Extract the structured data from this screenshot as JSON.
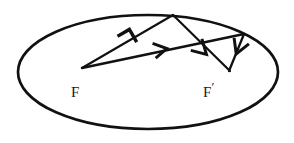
{
  "figure": {
    "stroke_color": "#111111",
    "background_color": "#ffffff",
    "labels": {
      "focus_left": "F",
      "focus_right": "F",
      "focus_right_prime": "′"
    },
    "ellipse": {
      "center_x": 148,
      "center_y": 72,
      "radius_x": 131,
      "radius_y": 58,
      "stroke_width": 2.6
    },
    "points": {
      "focus_left": [
        82,
        68
      ],
      "focus_right": [
        213,
        68
      ],
      "reflection_top": [
        172,
        15
      ],
      "reflection_right": [
        243,
        34
      ],
      "ray_end_lower": [
        230,
        71
      ]
    },
    "segments": [
      {
        "name": "ray-f-to-top-vertex",
        "from": [
          82,
          68
        ],
        "to": [
          172,
          15
        ]
      },
      {
        "name": "ray-f-to-right-vertex",
        "from": [
          82,
          68
        ],
        "to": [
          243,
          34
        ]
      },
      {
        "name": "reflected-top-to-fprime",
        "from": [
          172,
          15
        ],
        "to": [
          230,
          71
        ]
      },
      {
        "name": "reflected-right-to-fprime",
        "from": [
          243,
          34
        ],
        "to": [
          230,
          71
        ]
      }
    ],
    "arrowheads": [
      {
        "name": "arrow-outgoing-upper",
        "x": 132,
        "y": 36,
        "angle": -30,
        "direction": "up-right"
      },
      {
        "name": "arrow-outgoing-lower",
        "x": 164,
        "y": 49,
        "angle": -12,
        "direction": "right"
      },
      {
        "name": "arrow-incoming-from-top",
        "x": 203,
        "y": 52,
        "angle": 44,
        "direction": "down-right"
      },
      {
        "name": "arrow-incoming-from-right",
        "x": 238,
        "y": 52,
        "angle": 110,
        "direction": "down-left"
      }
    ]
  }
}
